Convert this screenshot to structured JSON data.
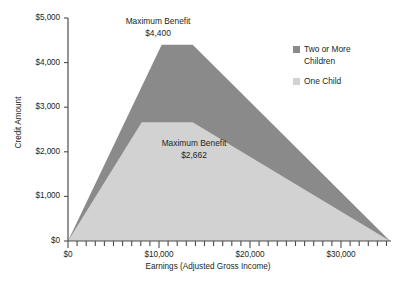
{
  "chart_data": {
    "type": "area",
    "title": "",
    "xlabel": "Earnings (Adjusted Gross Income)",
    "ylabel": "Credit Amount",
    "xlim": [
      0,
      35500
    ],
    "ylim": [
      0,
      5000
    ],
    "grid": false,
    "legend_position": "right",
    "x_tick_labels": [
      "$0",
      "$10,000",
      "$20,000",
      "$30,000"
    ],
    "x_tick_values": [
      0,
      10000,
      20000,
      30000
    ],
    "x_minor_tick_interval": 1000,
    "y_tick_labels": [
      "$0",
      "$1,000",
      "$2,000",
      "$3,000",
      "$4,000",
      "$5,000"
    ],
    "y_tick_values": [
      0,
      1000,
      2000,
      3000,
      4000,
      5000
    ],
    "series": [
      {
        "name": "Two or More Children",
        "color": "#8a8a8a",
        "x": [
          0,
          10300,
          13700,
          35400
        ],
        "values": [
          0,
          4400,
          4400,
          0
        ]
      },
      {
        "name": "One Child",
        "color": "#d2d2d2",
        "x": [
          0,
          8100,
          13700,
          35400
        ],
        "values": [
          0,
          2662,
          2662,
          0
        ]
      }
    ],
    "annotations": [
      {
        "name": "max-benefit-two-or-more",
        "line1": "Maximum Benefit",
        "line2": "$4,400"
      },
      {
        "name": "max-benefit-one-child",
        "line1": "Maximum Benefit",
        "line2": "$2,662"
      }
    ]
  },
  "legend": {
    "items": [
      {
        "label": "Two or More Children",
        "color": "#8a8a8a"
      },
      {
        "label": "One Child",
        "color": "#d2d2d2"
      }
    ]
  },
  "colors": {
    "two_or_more": "#8a8a8a",
    "one_child": "#d2d2d2",
    "axis": "#4d4d4d",
    "text": "#231f20"
  }
}
